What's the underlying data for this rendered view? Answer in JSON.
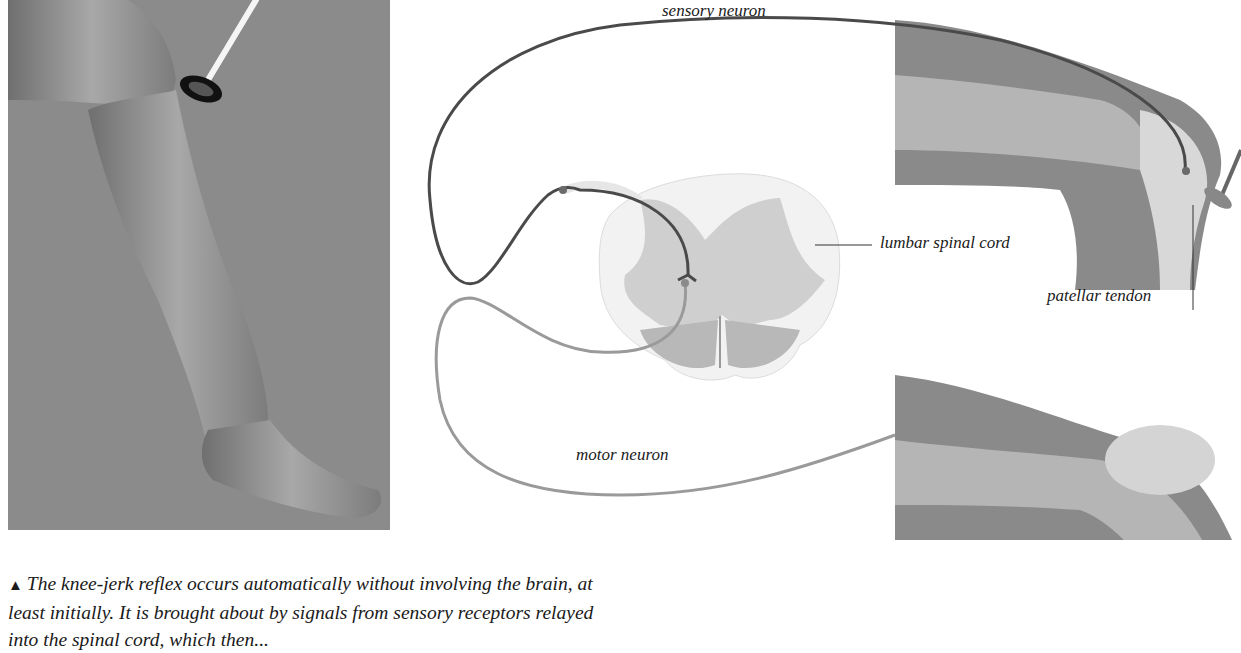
{
  "figure": {
    "photo": {
      "description": "Photograph of a lower leg being tapped below the knee with a reflex hammer",
      "background_color": "#8b8b8b"
    },
    "diagram": {
      "labels": {
        "sensory_neuron": "sensory neuron",
        "lumbar_spinal_cord": "lumbar spinal cord",
        "patellar_tendon": "patellar tendon",
        "motor_neuron": "motor neuron"
      },
      "colors": {
        "sensory_neuron": "#4a4a4a",
        "motor_neuron": "#9a9a9a",
        "grey_matter": "#cfcfcf",
        "white_matter": "#f2f2f2",
        "muscle": "#7a7a7a"
      }
    },
    "caption": {
      "marker": "▲",
      "lines": [
        "The knee-jerk reflex occurs automatically without involving the brain, at",
        "least initially. It is brought about by signals from sensory receptors relayed",
        "into the spinal cord, which then..."
      ]
    }
  }
}
